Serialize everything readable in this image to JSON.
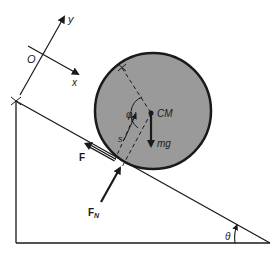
{
  "diagram": {
    "title": "",
    "colors": {
      "line": "#1a1a1a",
      "disk_fill": "#9a9a9a",
      "background": "#ffffff"
    },
    "axes": {
      "origin_label": "O",
      "x_label": "x",
      "y_label": "y"
    },
    "body": {
      "shape": "disk on incline",
      "center_label": "CM"
    },
    "forces": {
      "gravity_label": "mg",
      "friction_label": "F",
      "normal_label_main": "F",
      "normal_label_sub": "N"
    },
    "geometry_labels": {
      "angle_phi": "φ",
      "distance_s": "s",
      "incline_angle": "θ"
    }
  }
}
